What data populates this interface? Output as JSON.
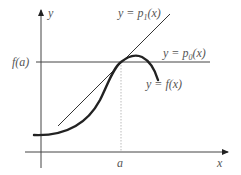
{
  "diagram": {
    "axes": {
      "x_label": "x",
      "y_label": "y"
    },
    "point_labels": {
      "a": "a",
      "fa": "f(a)"
    },
    "curves": [
      {
        "id": "f",
        "label": "y = f(x)",
        "style": "thick"
      },
      {
        "id": "p0",
        "label": "y = p0(x)",
        "label_main": "y = p",
        "label_sub": "0",
        "label_tail": "(x)",
        "style": "thin horizontal"
      },
      {
        "id": "p1",
        "label": "y = p1(x)",
        "label_main": "y = p",
        "label_sub": "1",
        "label_tail": "(x)",
        "style": "thin tangent line"
      }
    ],
    "colors": {
      "stroke": "#222222",
      "text": "#555555",
      "guide": "#aaaaaa"
    }
  }
}
